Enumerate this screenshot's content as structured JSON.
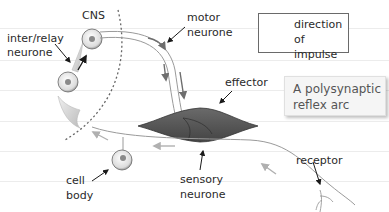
{
  "title": "A polysynaptic reflex arc",
  "labels": {
    "cns": "CNS",
    "relay_line1": "inter/relay",
    "relay_line2": "neurone",
    "motor_line1": "motor",
    "motor_line2": "neurone",
    "effector": "effector",
    "cell_body_line1": "cell",
    "cell_body_line2": "body",
    "sensory_line1": "sensory",
    "sensory_line2": "neurone",
    "receptor": "receptor"
  },
  "legend": {
    "icon": "arrow-icon",
    "line1": "direction",
    "line2": "of impulse"
  },
  "caption": {
    "line1": "A polysynaptic",
    "line2": "reflex arc"
  },
  "colors": {
    "neurone_line": "#9a9a9a",
    "effector_fill": "#5a5a5a",
    "impulse_arrow": "#7a7a7a",
    "sensory_arrow": "#b0b0b0",
    "label_arrow": "#1a1a1a",
    "ruled_line": "#ececec"
  }
}
